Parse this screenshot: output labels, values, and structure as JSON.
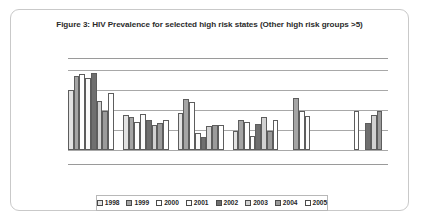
{
  "figure": {
    "title": "Figure 3: HIV Prevalence for selected high risk states (Other high risk groups >5)",
    "card_border_color": "#c9c9c9",
    "gridline_color": "#9a9a9a"
  },
  "legend": {
    "position": "bottom",
    "entries": [
      {
        "label": "1998",
        "swatch": "light-grey-swatch",
        "color": "#e2e2e2"
      },
      {
        "label": "1999",
        "swatch": "mid-grey-hatch-swatch",
        "color": "#a5a5a5"
      },
      {
        "label": "2000",
        "swatch": "white-swatch",
        "color": "#ffffff"
      },
      {
        "label": "2001",
        "swatch": "white-swatch",
        "color": "#fbfbfb"
      },
      {
        "label": "2002",
        "swatch": "dark-grey-swatch",
        "color": "#6f6f6f"
      },
      {
        "label": "2003",
        "swatch": "pale-grey-swatch",
        "color": "#d2d2d2"
      },
      {
        "label": "2004",
        "swatch": "mid-grey-swatch",
        "color": "#9b9b9b"
      },
      {
        "label": "2005",
        "swatch": "white-swatch",
        "color": "#ffffff"
      }
    ]
  },
  "chart_data": {
    "type": "bar",
    "title": "Figure 3: HIV Prevalence for selected high risk states (Other high risk groups >5)",
    "xlabel": "",
    "ylabel": "",
    "ylim": [
      0,
      10
    ],
    "grid": true,
    "gridlines": [
      2,
      4,
      6,
      8
    ],
    "tick_labels_visible": false,
    "axis_labels_visible": false,
    "legend_position": "bottom",
    "categories": [
      "Group 1",
      "Group 2",
      "Group 3",
      "Group 4",
      "Group 5",
      "Group 6"
    ],
    "series": [
      {
        "name": "1998",
        "values": [
          6.0,
          3.5,
          3.7,
          1.9,
          0.0,
          0.0
        ]
      },
      {
        "name": "1999",
        "values": [
          7.4,
          3.3,
          5.1,
          3.0,
          5.2,
          0.0
        ]
      },
      {
        "name": "2000",
        "values": [
          7.6,
          2.8,
          4.8,
          2.8,
          3.9,
          3.9
        ]
      },
      {
        "name": "2001",
        "values": [
          7.2,
          3.6,
          1.7,
          1.4,
          3.4,
          0.0
        ]
      },
      {
        "name": "2002",
        "values": [
          7.7,
          3.0,
          1.3,
          2.6,
          0.0,
          2.7
        ]
      },
      {
        "name": "2003",
        "values": [
          4.9,
          2.5,
          2.4,
          3.3,
          0.0,
          3.5
        ]
      },
      {
        "name": "2004",
        "values": [
          3.9,
          2.7,
          2.5,
          1.9,
          0.0,
          3.9
        ]
      },
      {
        "name": "2005",
        "values": [
          5.7,
          3.0,
          2.5,
          3.0,
          0.0,
          0.0
        ]
      }
    ],
    "bars": [
      {
        "group": 0,
        "series": "1998",
        "value": 6.0
      },
      {
        "group": 0,
        "series": "1999",
        "value": 7.4
      },
      {
        "group": 0,
        "series": "2000",
        "value": 7.6
      },
      {
        "group": 0,
        "series": "2001",
        "value": 7.2
      },
      {
        "group": 0,
        "series": "2002",
        "value": 7.7
      },
      {
        "group": 0,
        "series": "2003",
        "value": 4.9
      },
      {
        "group": 0,
        "series": "2004",
        "value": 3.9
      },
      {
        "group": 0,
        "series": "2005",
        "value": 5.7
      },
      {
        "group": 1,
        "series": "1998",
        "value": 3.5
      },
      {
        "group": 1,
        "series": "1999",
        "value": 3.3
      },
      {
        "group": 1,
        "series": "2000",
        "value": 2.8
      },
      {
        "group": 1,
        "series": "2001",
        "value": 3.6
      },
      {
        "group": 1,
        "series": "2002",
        "value": 3.0
      },
      {
        "group": 1,
        "series": "2003",
        "value": 2.5
      },
      {
        "group": 1,
        "series": "2004",
        "value": 2.7
      },
      {
        "group": 1,
        "series": "2005",
        "value": 3.0
      },
      {
        "group": 2,
        "series": "1998",
        "value": 3.7
      },
      {
        "group": 2,
        "series": "1999",
        "value": 5.1
      },
      {
        "group": 2,
        "series": "2000",
        "value": 4.8
      },
      {
        "group": 2,
        "series": "2001",
        "value": 1.7
      },
      {
        "group": 2,
        "series": "2002",
        "value": 1.3
      },
      {
        "group": 2,
        "series": "2003",
        "value": 2.4
      },
      {
        "group": 2,
        "series": "2004",
        "value": 2.5
      },
      {
        "group": 2,
        "series": "2005",
        "value": 2.5
      },
      {
        "group": 3,
        "series": "1998",
        "value": 0.9
      },
      {
        "group": 3,
        "series": "1999",
        "value": 3.0
      },
      {
        "group": 3,
        "series": "2000",
        "value": 2.8
      },
      {
        "group": 3,
        "series": "2001",
        "value": 2.4
      },
      {
        "group": 3,
        "series": "2002",
        "value": 2.6
      },
      {
        "group": 3,
        "series": "2003",
        "value": 3.3
      },
      {
        "group": 3,
        "series": "2004",
        "value": 1.9
      },
      {
        "group": 3,
        "series": "2005",
        "value": 3.0
      },
      {
        "group": 4,
        "series": "1999",
        "value": 5.2
      },
      {
        "group": 4,
        "series": "2000",
        "value": 3.9
      },
      {
        "group": 4,
        "series": "2001",
        "value": 3.4
      },
      {
        "group": 5,
        "series": "2002",
        "value": 2.7
      },
      {
        "group": 5,
        "series": "2003",
        "value": 3.5
      },
      {
        "group": 5,
        "series": "2004",
        "value": 3.9
      }
    ]
  }
}
